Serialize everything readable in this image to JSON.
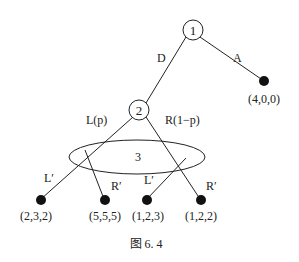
{
  "nodes": {
    "n1": {
      "label": "1"
    },
    "n2": {
      "label": "2"
    },
    "n3": {
      "label": "3"
    }
  },
  "edges": {
    "d": "D",
    "a": "A",
    "l": "L(p)",
    "r": "R(1−p)",
    "l_prime_left": "L′",
    "r_prime_left": "R′",
    "l_prime_right": "L′",
    "r_prime_right": "R′"
  },
  "payoffs": {
    "a": "(4,0,0)",
    "ll": "(2,3,2)",
    "lr": "(5,5,5)",
    "rl": "(1,2,3)",
    "rr": "(1,2,2)"
  },
  "caption": "图 6. 4",
  "colors": {
    "line": "#222222",
    "terminal": "#111111"
  }
}
